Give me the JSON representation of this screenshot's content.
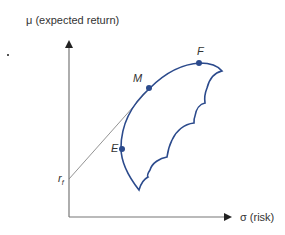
{
  "diagram": {
    "y_axis_label": "μ (expected return)",
    "x_axis_label": "σ (risk)",
    "rf_label": "r",
    "rf_subscript": "f",
    "points": {
      "M": "M",
      "F": "F",
      "E": "E"
    },
    "colors": {
      "curve": "#2b4a8c",
      "axes": "#555555",
      "tangent_line": "#666666"
    }
  }
}
